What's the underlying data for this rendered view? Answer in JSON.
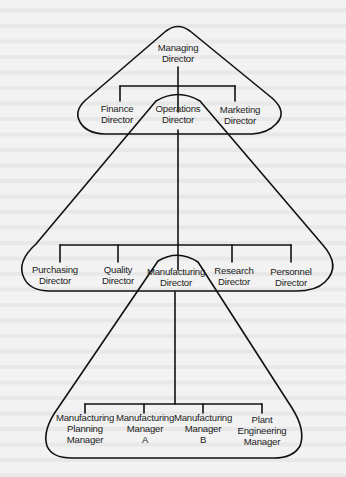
{
  "diagram": {
    "type": "organisation-chart",
    "style": {
      "line_color": "#111111",
      "text_color": "#222222",
      "background": "#f2f2f2"
    },
    "levels": [
      {
        "group": "board",
        "head": {
          "id": "managing",
          "lines": [
            "Managing",
            "Director"
          ]
        },
        "members": [
          {
            "id": "finance",
            "lines": [
              "Finance",
              "Director"
            ]
          },
          {
            "id": "operations",
            "lines": [
              "Operations",
              "Director"
            ]
          },
          {
            "id": "marketing",
            "lines": [
              "Marketing",
              "Director"
            ]
          }
        ]
      },
      {
        "group": "operations",
        "head": {
          "id": "operations",
          "lines": [
            "Operations",
            "Director"
          ]
        },
        "members": [
          {
            "id": "purchasing",
            "lines": [
              "Purchasing",
              "Director"
            ]
          },
          {
            "id": "quality",
            "lines": [
              "Quality",
              "Director"
            ]
          },
          {
            "id": "manufacturing",
            "lines": [
              "Manufacturing",
              "Director"
            ]
          },
          {
            "id": "research",
            "lines": [
              "Research",
              "Director"
            ]
          },
          {
            "id": "personnel",
            "lines": [
              "Personnel",
              "Director"
            ]
          }
        ]
      },
      {
        "group": "manufacturing",
        "head": {
          "id": "manufacturing",
          "lines": [
            "Manufacturing",
            "Director"
          ]
        },
        "members": [
          {
            "id": "mfg_planning",
            "lines": [
              "Manufacturing",
              "Planning",
              "Manager"
            ]
          },
          {
            "id": "mfg_a",
            "lines": [
              "Manufacturing",
              "Manager",
              "A"
            ]
          },
          {
            "id": "mfg_b",
            "lines": [
              "Manufacturing",
              "Manager",
              "B"
            ]
          },
          {
            "id": "plant_eng",
            "lines": [
              "Plant",
              "Engineering",
              "Manager"
            ]
          }
        ]
      }
    ]
  },
  "labels": {
    "managing": {
      "l1": "Managing",
      "l2": "Director"
    },
    "finance": {
      "l1": "Finance",
      "l2": "Director"
    },
    "operations": {
      "l1": "Operations",
      "l2": "Director"
    },
    "marketing": {
      "l1": "Marketing",
      "l2": "Director"
    },
    "purchasing": {
      "l1": "Purchasing",
      "l2": "Director"
    },
    "quality": {
      "l1": "Quality",
      "l2": "Director"
    },
    "manufacturing": {
      "l1": "Manufacturing",
      "l2": "Director"
    },
    "research": {
      "l1": "Research",
      "l2": "Director"
    },
    "personnel": {
      "l1": "Personnel",
      "l2": "Director"
    },
    "mfg_planning": {
      "l1": "Manufacturing",
      "l2": "Planning",
      "l3": "Manager"
    },
    "mfg_a": {
      "l1": "Manufacturing",
      "l2": "Manager",
      "l3": "A"
    },
    "mfg_b": {
      "l1": "Manufacturing",
      "l2": "Manager",
      "l3": "B"
    },
    "plant_eng": {
      "l1": "Plant",
      "l2": "Engineering",
      "l3": "Manager"
    }
  }
}
